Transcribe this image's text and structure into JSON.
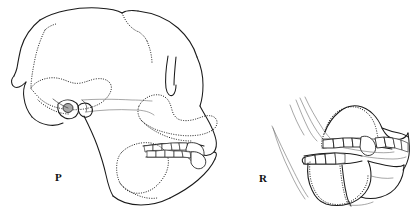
{
  "figure": {
    "background_color": "#ffffff",
    "line_color": "#1a1a1a",
    "width": 413,
    "height": 211,
    "technique": "ink line drawing; solid lines = preserved bone, dotted lines = sutures / reconstructed or obscured margins"
  },
  "specimens": [
    {
      "id": "P",
      "label": "P",
      "label_x": 55,
      "label_y": 181,
      "description": "Nearly complete cranium with mandible in left lateral view, large and heavily built",
      "parts": [
        "neurocranium",
        "sagittal region",
        "temporal line",
        "orbit",
        "auditory region",
        "zygomatic arch",
        "maxilla",
        "mandible",
        "maxillary tooth row",
        "mandibular tooth row",
        "canine",
        "incisors"
      ]
    },
    {
      "id": "R",
      "label": "R",
      "label_x": 259,
      "label_y": 182,
      "description": "Partial facial skeleton with maxilla and mandible preserving occluding tooth rows, left lateral view",
      "parts": [
        "maxilla fragment",
        "palate",
        "mandible fragment",
        "maxillary tooth row",
        "mandibular tooth row",
        "canine",
        "premolars",
        "molars"
      ]
    }
  ],
  "labels": {
    "left_specimen": "P",
    "right_specimen": "R"
  },
  "legend_note": {
    "solid": "preserved outline",
    "dotted": "suture / reconstructed margin",
    "shaded": "auditory ossicle region"
  }
}
